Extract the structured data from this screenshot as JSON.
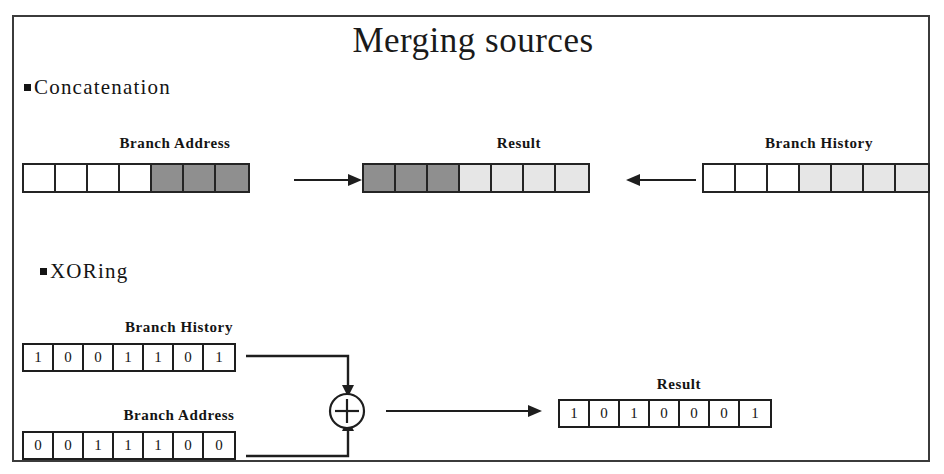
{
  "slide": {
    "title": "Merging sources",
    "background_color": "#ffffff",
    "frame_color": "#3b3b3b",
    "text_color": "#141414"
  },
  "palette": {
    "dark_cell": "#8f8f8f",
    "light_cell": "#e6e6e6",
    "white_cell": "#ffffff",
    "cell_border": "#242424"
  },
  "sections": {
    "concatenation": {
      "bullet_label": "Concatenation",
      "branch_address": {
        "caption": "Branch Address",
        "cells": [
          "white",
          "white",
          "white",
          "white",
          "dark",
          "dark",
          "dark"
        ]
      },
      "result": {
        "caption": "Result",
        "cells": [
          "dark",
          "dark",
          "dark",
          "light",
          "light",
          "light",
          "light"
        ]
      },
      "branch_history": {
        "caption": "Branch History",
        "cells": [
          "white",
          "white",
          "white",
          "light",
          "light",
          "light",
          "light"
        ]
      },
      "arrow_left_to_result": "arrow-right-icon",
      "arrow_right_to_result": "arrow-left-icon"
    },
    "xoring": {
      "bullet_label": "XORing",
      "branch_history": {
        "caption": "Branch History",
        "bits": [
          "1",
          "0",
          "0",
          "1",
          "1",
          "0",
          "1"
        ]
      },
      "branch_address": {
        "caption": "Branch Address",
        "bits": [
          "0",
          "0",
          "1",
          "1",
          "1",
          "0",
          "0"
        ]
      },
      "result": {
        "caption": "Result",
        "bits": [
          "1",
          "0",
          "1",
          "0",
          "0",
          "0",
          "1"
        ]
      },
      "operator_symbol": "+",
      "operator_name": "xor-gate"
    }
  }
}
